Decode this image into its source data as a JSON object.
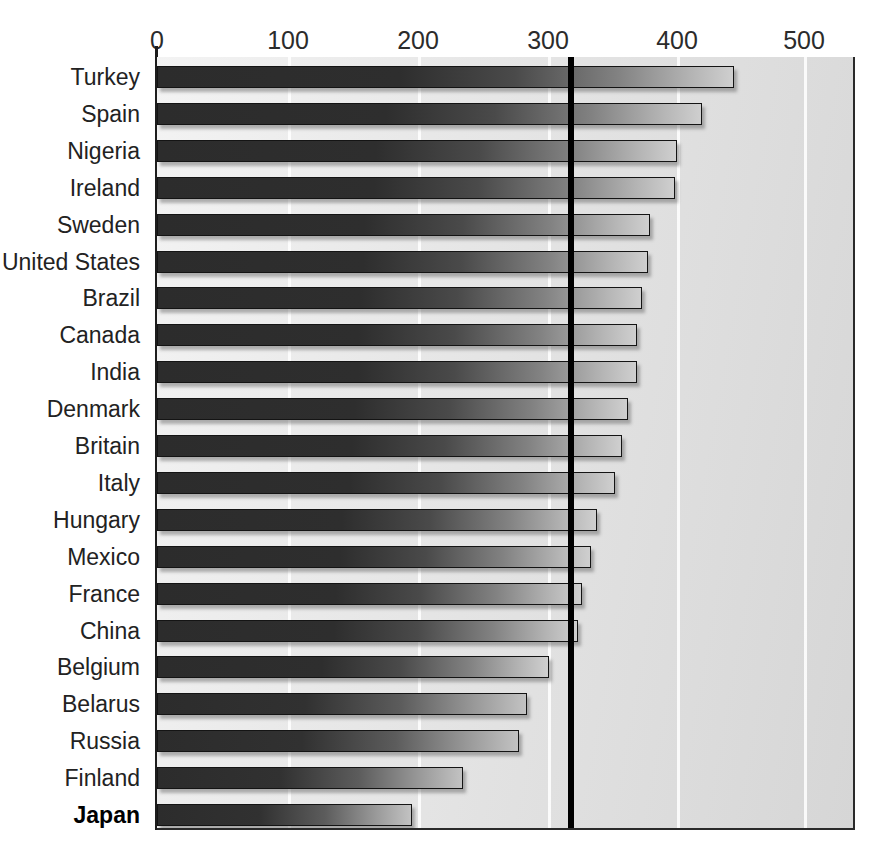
{
  "chart_data": {
    "type": "bar",
    "orientation": "horizontal",
    "title": "",
    "xlabel": "",
    "ylabel": "",
    "xlim": [
      0,
      540
    ],
    "xticks": [
      0,
      100,
      200,
      300,
      400,
      500
    ],
    "xtick_labels": [
      "0",
      "100",
      "200",
      "300",
      "400",
      "500"
    ],
    "grid": true,
    "gridlines_at": [
      100,
      200,
      300,
      400,
      500
    ],
    "legend": null,
    "annotations": [
      {
        "name": "threshold-line",
        "type": "vertical-line",
        "value": 320,
        "color": "#000000",
        "label": ""
      }
    ],
    "categories": [
      "Turkey",
      "Spain",
      "Nigeria",
      "Ireland",
      "Sweden",
      "United States",
      "Brazil",
      "Canada",
      "India",
      "Denmark",
      "Britain",
      "Italy",
      "Hungary",
      "Mexico",
      "France",
      "China",
      "Belgium",
      "Belarus",
      "Russia",
      "Finland",
      "Japan"
    ],
    "values": [
      446,
      421,
      402,
      400,
      381,
      379,
      375,
      371,
      371,
      364,
      359,
      354,
      340,
      335,
      328,
      325,
      303,
      286,
      280,
      236,
      197
    ],
    "highlighted_categories": [
      "Japan"
    ],
    "colors": {
      "bar_fill_dark": "#2c2c2c",
      "bar_fill_light": "#cfcfcf",
      "bar_border": "#141414",
      "plot_background": "#e4e4e4",
      "axis": "#1d1d1d",
      "threshold": "#000000",
      "gridline": "#ffffff",
      "text": "#222222"
    }
  }
}
